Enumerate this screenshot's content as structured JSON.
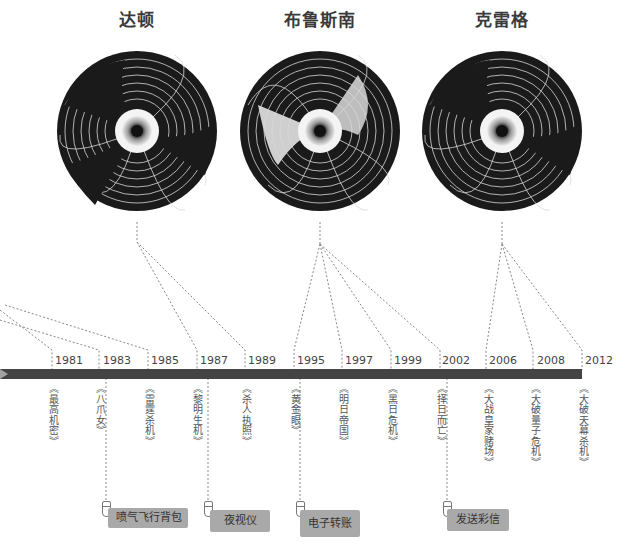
{
  "actors": [
    {
      "name": "达顿",
      "center_x": 137
    },
    {
      "name": "布鲁斯南",
      "center_x": 320
    },
    {
      "name": "克雷格",
      "center_x": 502
    }
  ],
  "timeline": {
    "bar_color": "#444444",
    "years": [
      "1981",
      "1983",
      "1985",
      "1987",
      "1989",
      "1995",
      "1997",
      "1999",
      "2002",
      "2006",
      "2008",
      "2012"
    ],
    "films": [
      "《最高机密》",
      "《八爪女》",
      "《雷霆杀机》",
      "《黎明生机》",
      "《杀人执照》",
      "《黄金眼》",
      "《明日帝国》",
      "《黑日危机》",
      "《择日而亡》",
      "《大战皇家赌场》",
      "《大破量子危机》",
      "《大破天幕杀机》"
    ]
  },
  "gadgets": [
    {
      "label": "喷气飞行背包",
      "film_year": "1983"
    },
    {
      "label": "夜视仪",
      "film_year": "1987"
    },
    {
      "label": "电子转账",
      "film_year": "1995"
    },
    {
      "label": "发送彩信",
      "film_year": "2002"
    }
  ],
  "colors": {
    "barrel": "#1a1a1a",
    "gadget_bg": "#a9a9a9",
    "connector": "#888888"
  }
}
